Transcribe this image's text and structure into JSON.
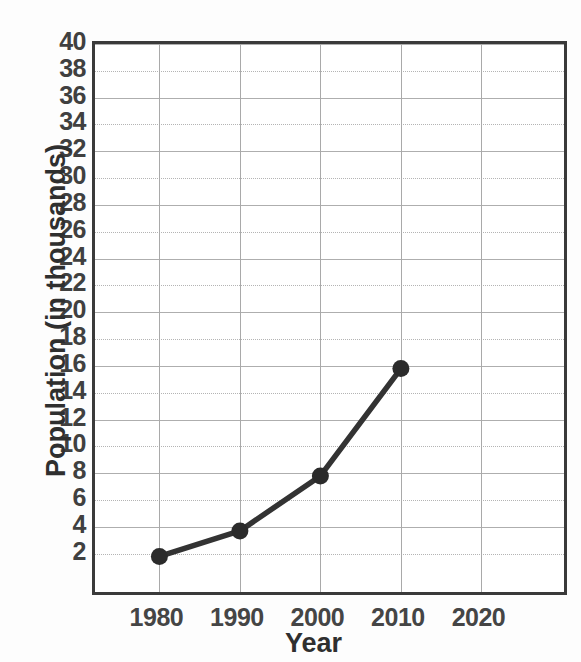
{
  "chart_data": {
    "type": "line",
    "title": "",
    "xlabel": "Year",
    "ylabel": "Population (in thousands)",
    "x": [
      1980,
      1990,
      2000,
      2010
    ],
    "values": [
      1.8,
      3.7,
      7.8,
      15.8
    ],
    "series": [
      {
        "name": "Population",
        "x": [
          1980,
          1990,
          2000,
          2010
        ],
        "values": [
          1.8,
          3.7,
          7.8,
          15.8
        ]
      }
    ],
    "xlim": [
      1972,
      2031
    ],
    "ylim": [
      -1.3,
      40
    ],
    "x_tick_labels": [
      "1980",
      "1990",
      "2000",
      "2010",
      "2020"
    ],
    "x_ticks": [
      1980,
      1990,
      2000,
      2010,
      2020
    ],
    "y_tick_labels": [
      "40",
      "38",
      "36",
      "34",
      "32",
      "30",
      "28",
      "26",
      "24",
      "22",
      "20",
      "18",
      "16",
      "14",
      "12",
      "10",
      "8",
      "6",
      "4",
      "2"
    ],
    "y_ticks": [
      40,
      38,
      36,
      34,
      32,
      30,
      28,
      26,
      24,
      22,
      20,
      18,
      16,
      14,
      12,
      10,
      8,
      6,
      4,
      2
    ],
    "grid": true,
    "grid_axis": "both",
    "legend": false,
    "legend_position": "none",
    "marker": "filled-circle",
    "line_color": "#333333",
    "marker_color": "#2b2b2b",
    "grid_color": "#b0b0b0",
    "frame_color": "#3a3a3a"
  }
}
